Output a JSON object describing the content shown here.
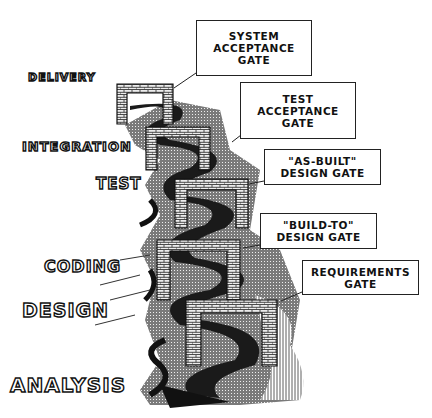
{
  "diagram": {
    "phases": [
      {
        "label": "DELIVERY"
      },
      {
        "label": "INTEGRATION"
      },
      {
        "label": "TEST"
      },
      {
        "label": "CODING"
      },
      {
        "label": "DESIGN"
      },
      {
        "label": "ANALYSIS"
      }
    ],
    "gates": [
      {
        "lines": [
          "SYSTEM",
          "ACCEPTANCE",
          "GATE"
        ]
      },
      {
        "lines": [
          "TEST",
          "ACCEPTANCE",
          "GATE"
        ]
      },
      {
        "lines": [
          "\"AS-BUILT\"",
          "DESIGN GATE"
        ]
      },
      {
        "lines": [
          "\"BUILD-TO\"",
          "DESIGN GATE"
        ]
      },
      {
        "lines": [
          "REQUIREMENTS",
          "GATE"
        ]
      }
    ],
    "colors": {
      "ink": "#111111",
      "brick": "#e8e8e8",
      "river": "#555555",
      "ground": "#9a9a9a",
      "paper": "#ffffff"
    }
  }
}
